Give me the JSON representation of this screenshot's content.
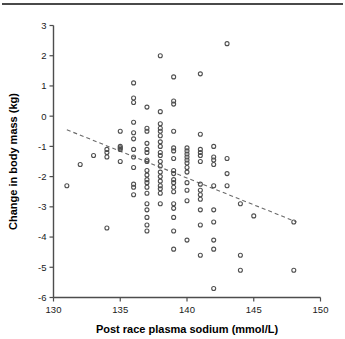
{
  "figure": {
    "has_top_rule": true,
    "background_color": "#ffffff"
  },
  "chart_data": {
    "type": "scatter",
    "title": "",
    "xlabel": "Post race plasma sodium (mmol/L)",
    "ylabel": "Change in body mass (kg)",
    "xlim": [
      130,
      150
    ],
    "ylim": [
      -6,
      3
    ],
    "xticks": [
      130,
      135,
      140,
      145,
      150
    ],
    "xtick_labels": [
      "130",
      "135",
      "140",
      "145",
      "150"
    ],
    "yticks": [
      3,
      2,
      1,
      0,
      -1,
      -2,
      -3,
      -4,
      -5,
      -6
    ],
    "ytick_labels": [
      "3",
      "2",
      "1",
      "0",
      "-1",
      "-2",
      "-3",
      "-4",
      "-5",
      "-6"
    ],
    "grid": false,
    "legend": null,
    "marker_style": "open-circle",
    "marker_color": "#4f4f4f",
    "points": [
      [
        131,
        -2.3
      ],
      [
        132,
        -1.6
      ],
      [
        133,
        -1.3
      ],
      [
        134,
        -1.1
      ],
      [
        134,
        -1.2
      ],
      [
        134,
        -1.35
      ],
      [
        134,
        -3.7
      ],
      [
        135,
        -0.5
      ],
      [
        135,
        -1.0
      ],
      [
        135,
        -1.05
      ],
      [
        135,
        -1.1
      ],
      [
        135,
        -1.5
      ],
      [
        136,
        1.1
      ],
      [
        136,
        0.6
      ],
      [
        136,
        0.45
      ],
      [
        136,
        -0.2
      ],
      [
        136,
        -0.55
      ],
      [
        136,
        -0.75
      ],
      [
        136,
        -1.1
      ],
      [
        136,
        -1.35
      ],
      [
        136,
        -1.7
      ],
      [
        136,
        -2.25
      ],
      [
        136,
        -2.35
      ],
      [
        136,
        -2.6
      ],
      [
        137,
        0.3
      ],
      [
        137,
        -0.4
      ],
      [
        137,
        -0.5
      ],
      [
        137,
        -0.9
      ],
      [
        137,
        -1.1
      ],
      [
        137,
        -1.2
      ],
      [
        137,
        -1.45
      ],
      [
        137,
        -1.5
      ],
      [
        137,
        -1.8
      ],
      [
        137,
        -1.95
      ],
      [
        137,
        -2.1
      ],
      [
        137,
        -2.2
      ],
      [
        137,
        -2.35
      ],
      [
        137,
        -2.55
      ],
      [
        137,
        -2.9
      ],
      [
        137,
        -3.1
      ],
      [
        137,
        -3.35
      ],
      [
        137,
        -3.6
      ],
      [
        137,
        -3.8
      ],
      [
        138,
        2.0
      ],
      [
        138,
        0.15
      ],
      [
        138,
        -0.25
      ],
      [
        138,
        -0.4
      ],
      [
        138,
        -0.5
      ],
      [
        138,
        -0.65
      ],
      [
        138,
        -0.85
      ],
      [
        138,
        -1.0
      ],
      [
        138,
        -1.2
      ],
      [
        138,
        -1.3
      ],
      [
        138,
        -1.5
      ],
      [
        138,
        -1.65
      ],
      [
        138,
        -1.85
      ],
      [
        138,
        -2.0
      ],
      [
        138,
        -2.15
      ],
      [
        138,
        -2.3
      ],
      [
        138,
        -2.4
      ],
      [
        138,
        -2.55
      ],
      [
        138,
        -2.9
      ],
      [
        139,
        1.3
      ],
      [
        139,
        0.5
      ],
      [
        139,
        0.4
      ],
      [
        139,
        -0.5
      ],
      [
        139,
        -1.05
      ],
      [
        139,
        -1.15
      ],
      [
        139,
        -1.4
      ],
      [
        139,
        -1.8
      ],
      [
        139,
        -1.9
      ],
      [
        139,
        -2.1
      ],
      [
        139,
        -2.2
      ],
      [
        139,
        -2.35
      ],
      [
        139,
        -2.5
      ],
      [
        139,
        -2.9
      ],
      [
        139,
        -3.05
      ],
      [
        139,
        -3.35
      ],
      [
        139,
        -3.8
      ],
      [
        139,
        -4.4
      ],
      [
        140,
        -1.05
      ],
      [
        140,
        -1.15
      ],
      [
        140,
        -1.25
      ],
      [
        140,
        -1.35
      ],
      [
        140,
        -1.45
      ],
      [
        140,
        -1.55
      ],
      [
        140,
        -1.7
      ],
      [
        140,
        -1.85
      ],
      [
        140,
        -2.2
      ],
      [
        140,
        -2.45
      ],
      [
        140,
        -2.8
      ],
      [
        140,
        -4.1
      ],
      [
        141,
        1.4
      ],
      [
        141,
        -0.6
      ],
      [
        141,
        -1.1
      ],
      [
        141,
        -1.2
      ],
      [
        141,
        -1.3
      ],
      [
        141,
        -1.5
      ],
      [
        141,
        -2.25
      ],
      [
        141,
        -2.45
      ],
      [
        141,
        -2.6
      ],
      [
        141,
        -2.75
      ],
      [
        141,
        -3.1
      ],
      [
        141,
        -3.6
      ],
      [
        141,
        -4.6
      ],
      [
        142,
        -1.0
      ],
      [
        142,
        -1.35
      ],
      [
        142,
        -1.45
      ],
      [
        142,
        -1.6
      ],
      [
        142,
        -2.3
      ],
      [
        142,
        -3.1
      ],
      [
        142,
        -3.5
      ],
      [
        142,
        -4.1
      ],
      [
        142,
        -4.4
      ],
      [
        142,
        -5.7
      ],
      [
        143,
        2.4
      ],
      [
        143,
        -1.4
      ],
      [
        143,
        -1.9
      ],
      [
        143,
        -2.3
      ],
      [
        144,
        -2.9
      ],
      [
        144,
        -4.6
      ],
      [
        144,
        -5.1
      ],
      [
        145,
        -3.3
      ],
      [
        148,
        -3.5
      ],
      [
        148,
        -5.1
      ]
    ],
    "trendline": {
      "style": "dashed",
      "color": "#6b6b6b",
      "x_start": 131.0,
      "y_start": -0.45,
      "x_end": 148.2,
      "y_end": -3.5
    }
  }
}
